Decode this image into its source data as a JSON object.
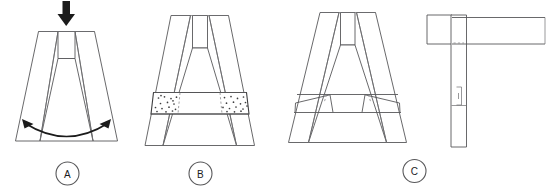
{
  "diagram": {
    "background_color": "#ffffff",
    "line_color": "#58585a",
    "accent_color": "#1b1b1b",
    "panels": [
      {
        "id": "A",
        "label": "A",
        "caption": "",
        "annotations": {
          "load_arrow": "downward-load-arrow",
          "spread_arrow": "spreading-double-arrow"
        }
      },
      {
        "id": "B",
        "label": "B",
        "caption": "",
        "annotations": {
          "band": "stippled-tie-band"
        }
      },
      {
        "id": "C",
        "label": "C",
        "caption": "",
        "annotations": {
          "band": "angled-brace-band"
        }
      },
      {
        "id": "side",
        "label": "",
        "caption": "",
        "annotations": {
          "view": "side-elevation"
        }
      }
    ]
  }
}
